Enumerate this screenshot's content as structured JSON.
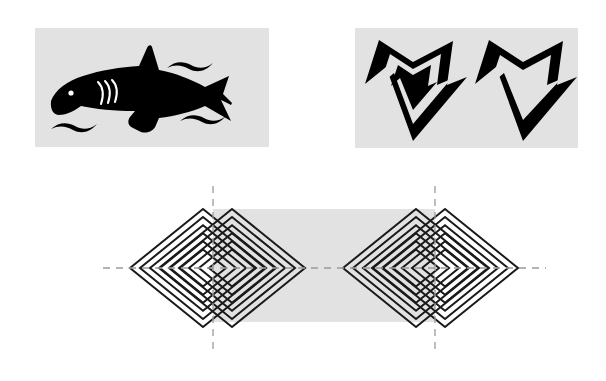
{
  "page": {
    "background_color": "#ffffff",
    "width": 606,
    "height": 381
  },
  "panels": [
    {
      "id": "shark-panel",
      "name": "shark-silhouette-panel",
      "background_color": "#e2e2e2",
      "ink_color": "#000000",
      "x": 35,
      "y": 28,
      "width": 234,
      "height": 119,
      "subject": "shark",
      "description": "Black silhouette of a shark facing left with dorsal fin, pectoral fin, crescent tail, eye dot, three gill slits and four wave strokes",
      "elements": [
        "shark-body-silhouette",
        "shark-eye-dot",
        "shark-gill-slits",
        "wave-stroke-top-right",
        "wave-stroke-bottom-left",
        "wave-stroke-bottom-right"
      ]
    },
    {
      "id": "stars-panel",
      "name": "stars-panel",
      "background_color": "#e2e2e2",
      "ink_color": "#000000",
      "x": 355,
      "y": 28,
      "width": 223,
      "height": 120,
      "subject": "two five-pointed stars",
      "description": "Left star: thick outlined point-down star containing a solid filled inner star. Right star: thick outlined point-down star with hollow white interior",
      "elements": [
        "star-left-outlined-with-solid-core",
        "star-right-outlined-hollow"
      ],
      "stars": [
        {
          "name": "star-left",
          "style": "outline-with-filled-core",
          "orientation": "point-down",
          "points": 5
        },
        {
          "name": "star-right",
          "style": "outline-hollow",
          "orientation": "point-down",
          "points": 5
        }
      ]
    }
  ],
  "diagram": {
    "name": "nested-diamonds-diagram",
    "x": 0,
    "y": 175,
    "width": 606,
    "height": 200,
    "stroke_color": "#1a1a1a",
    "dash_color": "#9a9a9a",
    "band_color": "#e2e2e2",
    "band": {
      "name": "gray-band",
      "x": 213,
      "y": 209,
      "width": 222,
      "height": 113
    },
    "axes": {
      "horizontal_centerline": {
        "y": 268,
        "x_start": 103,
        "x_end": 546
      },
      "vertical_centerlines": [
        {
          "x": 213,
          "y_start": 186,
          "y_end": 353
        },
        {
          "x": 435,
          "y_start": 186,
          "y_end": 353
        }
      ]
    },
    "clusters": [
      {
        "name": "diamond-cluster-left",
        "center_y": 268,
        "sets": [
          {
            "name": "diamond-set-left-outer",
            "center_x": 203,
            "count": 6
          },
          {
            "name": "diamond-set-left-inner",
            "center_x": 232,
            "count": 6
          }
        ]
      },
      {
        "name": "diamond-cluster-right",
        "center_y": 268,
        "sets": [
          {
            "name": "diamond-set-right-outer",
            "center_x": 416,
            "count": 6
          },
          {
            "name": "diamond-set-right-inner",
            "center_x": 445,
            "count": 6
          }
        ]
      }
    ],
    "diamond_geometry": {
      "count_per_set": 6,
      "largest_half_width": 73,
      "largest_half_height": 59,
      "step": 10,
      "stroke_width": 2
    }
  }
}
